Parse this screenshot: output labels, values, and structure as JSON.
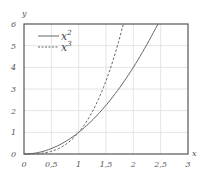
{
  "chart_data": {
    "type": "line",
    "title": "",
    "xlabel": "x",
    "ylabel": "y",
    "xlim": [
      0,
      3
    ],
    "ylim": [
      0,
      6
    ],
    "grid": true,
    "legend_position": "upper left",
    "x_ticks": [
      "0",
      "0,5",
      "1",
      "1,5",
      "2",
      "2,5",
      "3"
    ],
    "y_ticks": [
      "0",
      "1",
      "2",
      "3",
      "4",
      "5",
      "6"
    ],
    "series": [
      {
        "name": "x^2",
        "label_base": "x",
        "label_exp": "2",
        "style": "solid",
        "x": [
          0,
          0.25,
          0.5,
          0.75,
          1,
          1.25,
          1.5,
          1.75,
          2,
          2.25,
          2.45
        ],
        "y": [
          0,
          0.0625,
          0.25,
          0.5625,
          1,
          1.5625,
          2.25,
          3.0625,
          4,
          5.0625,
          6.0
        ]
      },
      {
        "name": "x^3",
        "label_base": "x",
        "label_exp": "3",
        "style": "dashed",
        "x": [
          0,
          0.25,
          0.5,
          0.75,
          1,
          1.25,
          1.5,
          1.75,
          1.817
        ],
        "y": [
          0,
          0.0156,
          0.125,
          0.4219,
          1,
          1.9531,
          3.375,
          5.3594,
          6.0
        ]
      }
    ]
  }
}
